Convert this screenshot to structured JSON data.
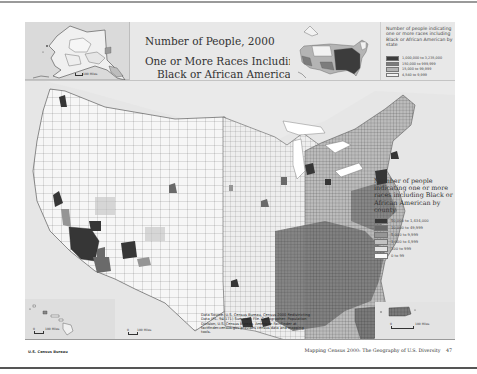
{
  "page": {
    "footer_left": "U.S. Census Bureau",
    "footer_right": "Mapping Census 2000: The Geography of U.S. Diversity",
    "page_number": "47"
  },
  "title": {
    "line1": "Number of People, 2000",
    "line2": "One or More Races Including",
    "line3": "Black or African American"
  },
  "state_legend": {
    "title": "Number of people indicating one or more races including Black or African American by state",
    "classes": [
      {
        "label": "1,000,000 to 3,235,000",
        "color": "#3c3c3c"
      },
      {
        "label": "150,000 to 999,999",
        "color": "#7c7c7c"
      },
      {
        "label": "15,000 to 99,999",
        "color": "#b4b4b4"
      },
      {
        "label": "4,540 to 9,999",
        "color": "#f2f2f2"
      }
    ]
  },
  "county_legend": {
    "title": "Number of people indicating one or more races including Black or African American by county",
    "classes": [
      {
        "label": "50,000 to 1,434,000",
        "color": "#363636"
      },
      {
        "label": "10,000 to 49,999",
        "color": "#6a6a6a"
      },
      {
        "label": "5,000 to 9,999",
        "color": "#959595"
      },
      {
        "label": "1,000 to 4,999",
        "color": "#c2c2c2"
      },
      {
        "label": "100 to 999",
        "color": "#e2e2e2"
      },
      {
        "label": "0 to 99",
        "color": "#f8f8f8"
      }
    ]
  },
  "source_note": "Data Source: U.S. Census Bureau, Census 2000 Redistricting Data (P.L. 94-171) Summary File. Cartographer: Population Division, U.S. Census Bureau. American FactFinder at factfinder.census.gov provides census data and mapping tools.",
  "insets": {
    "alaska_scale": "100 Miles",
    "hawaii_scale": "100 Miles",
    "mainland_scale": "100 Miles",
    "pr_scale": "100 Miles",
    "scale_zero": "0"
  },
  "colors": {
    "water": "#e6e6e6",
    "county_border": "#555555"
  }
}
